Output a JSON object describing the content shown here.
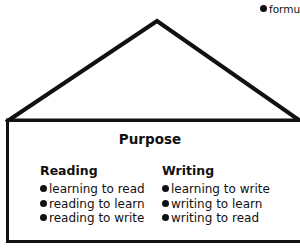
{
  "corner_label": "formu",
  "roof": {
    "apex": [
      157,
      21
    ],
    "left": [
      6,
      120
    ],
    "right": [
      299,
      120
    ]
  },
  "box": {
    "title": "Purpose"
  },
  "columns": [
    {
      "heading": "Reading",
      "items": [
        "learning to read",
        "reading to learn",
        "reading to write"
      ]
    },
    {
      "heading": "Writing",
      "items": [
        "learning to write",
        "writing to learn",
        "writing to read"
      ]
    }
  ]
}
